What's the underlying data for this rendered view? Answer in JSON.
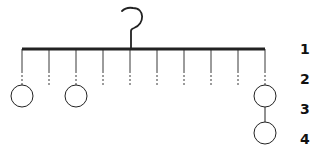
{
  "diagram": {
    "type": "hanging-mobile",
    "colors": {
      "stroke": "#222222",
      "background": "#ffffff"
    },
    "hook": {
      "stem_x": 131,
      "top_y": 7,
      "bar_y": 49
    },
    "bar": {
      "x1": 22,
      "x2": 265,
      "y": 49
    },
    "strings": [
      22,
      49,
      76,
      103,
      130,
      157,
      184,
      211,
      238,
      265
    ],
    "circles": [
      {
        "cx": 22,
        "cy": 96,
        "r": 11
      },
      {
        "cx": 76,
        "cy": 96,
        "r": 11
      },
      {
        "cx": 265,
        "cy": 96,
        "r": 11
      },
      {
        "cx": 265,
        "cy": 133,
        "r": 11
      }
    ],
    "level_labels": [
      {
        "text": "1",
        "y": 54
      },
      {
        "text": "2",
        "y": 84
      },
      {
        "text": "3",
        "y": 114
      },
      {
        "text": "4",
        "y": 144
      }
    ]
  }
}
